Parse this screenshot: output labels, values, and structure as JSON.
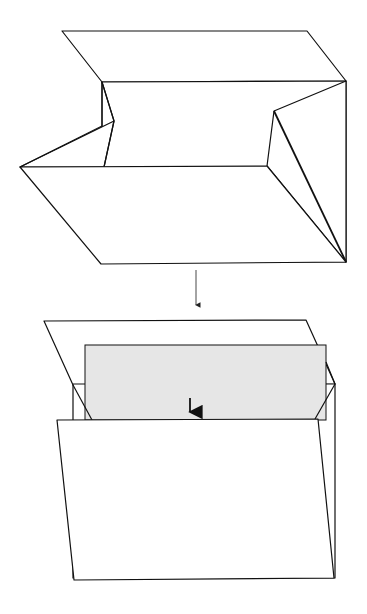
{
  "diagram": {
    "type": "folding-instructions",
    "steps": [
      {
        "id": "step-1",
        "description": "open box with folded-in end flaps"
      },
      {
        "id": "step-2",
        "description": "sheet inserted into box, arrow pointing down"
      }
    ],
    "connector_arrow": "down-arrow-between-steps",
    "colors": {
      "line": "#111111",
      "sheet_fill": "#e6e6e6",
      "background": "#ffffff"
    }
  }
}
